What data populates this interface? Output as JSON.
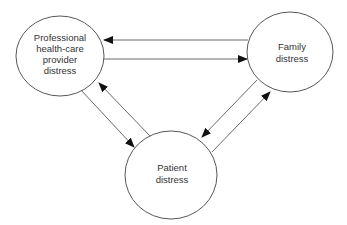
{
  "diagram": {
    "type": "cyclic-relationship",
    "nodes": [
      {
        "id": "provider",
        "lines": [
          "Professional",
          "health-care",
          "provider",
          "distress"
        ]
      },
      {
        "id": "family",
        "lines": [
          "Family",
          "distress"
        ]
      },
      {
        "id": "patient",
        "lines": [
          "Patient",
          "distress"
        ]
      }
    ],
    "edges": [
      {
        "from": "family",
        "to": "provider"
      },
      {
        "from": "provider",
        "to": "family"
      },
      {
        "from": "provider",
        "to": "patient"
      },
      {
        "from": "patient",
        "to": "provider"
      },
      {
        "from": "family",
        "to": "patient"
      },
      {
        "from": "patient",
        "to": "family"
      }
    ],
    "colors": {
      "stroke": "#444444",
      "text": "#333333",
      "background": "#ffffff"
    }
  }
}
